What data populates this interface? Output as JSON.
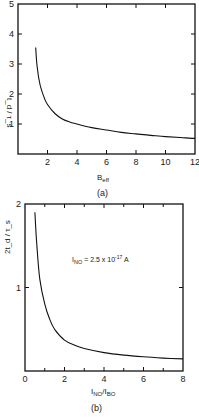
{
  "chart_data": [
    {
      "type": "line",
      "panel": "(a)",
      "caption": "(a)",
      "title": "",
      "xlabel": "B_eff",
      "ylabel": "t_d / τ_s",
      "xlim": [
        0,
        12
      ],
      "ylim": [
        0,
        5
      ],
      "xticks": [
        2,
        4,
        6,
        8,
        10,
        12
      ],
      "yticks": [
        1,
        2,
        3,
        4,
        5
      ],
      "grid": false,
      "series": [
        {
          "name": "curve",
          "x": [
            1.2,
            1.3,
            1.5,
            1.8,
            2.0,
            2.5,
            3.0,
            3.5,
            4.0,
            5.0,
            6.0,
            7.0,
            8.0,
            9.0,
            10.0,
            11.0,
            12.0
          ],
          "y": [
            3.55,
            2.9,
            2.3,
            1.85,
            1.65,
            1.35,
            1.17,
            1.07,
            1.0,
            0.88,
            0.8,
            0.72,
            0.67,
            0.62,
            0.58,
            0.55,
            0.52
          ]
        }
      ]
    },
    {
      "type": "line",
      "panel": "(b)",
      "caption": "(b)",
      "title": "",
      "xlabel": "I_NO / I_BO",
      "ylabel": "2t_d / τ_s",
      "xlim": [
        0,
        8
      ],
      "ylim": [
        0,
        2
      ],
      "xticks": [
        0,
        2,
        4,
        6,
        8
      ],
      "yticks": [
        1,
        2
      ],
      "grid": false,
      "annotations": [
        "I_NO = 2.5 x 10^-17 A"
      ],
      "series": [
        {
          "name": "curve",
          "x": [
            0.5,
            0.6,
            0.75,
            1.0,
            1.25,
            1.5,
            2.0,
            2.5,
            3.0,
            4.0,
            5.0,
            6.0,
            7.0,
            8.0
          ],
          "y": [
            1.9,
            1.5,
            1.1,
            0.8,
            0.62,
            0.5,
            0.37,
            0.31,
            0.27,
            0.22,
            0.19,
            0.17,
            0.155,
            0.145
          ]
        }
      ]
    }
  ],
  "labels": {
    "a": {
      "caption": "(a)",
      "xlabel_main": "B",
      "xlabel_sub": "eff",
      "ylabel": "t_d / τ_s",
      "xticks": [
        "2",
        "4",
        "6",
        "8",
        "10",
        "12"
      ],
      "yticks": [
        "1",
        "2",
        "3",
        "4",
        "5"
      ]
    },
    "b": {
      "caption": "(b)",
      "xlabel_1": "I",
      "xlabel_1_sub": "NO",
      "xlabel_sep": "/I",
      "xlabel_2_sub": "BO",
      "ylabel": "2t_d / τ_s",
      "xticks": [
        "0",
        "2",
        "4",
        "6",
        "8"
      ],
      "yticks": [
        "1",
        "2"
      ],
      "annotation_main": "I",
      "annotation_sub": "NO",
      "annotation_rest": " = 2.5 x 10",
      "annotation_exp": "-17",
      "annotation_unit": " A"
    }
  }
}
